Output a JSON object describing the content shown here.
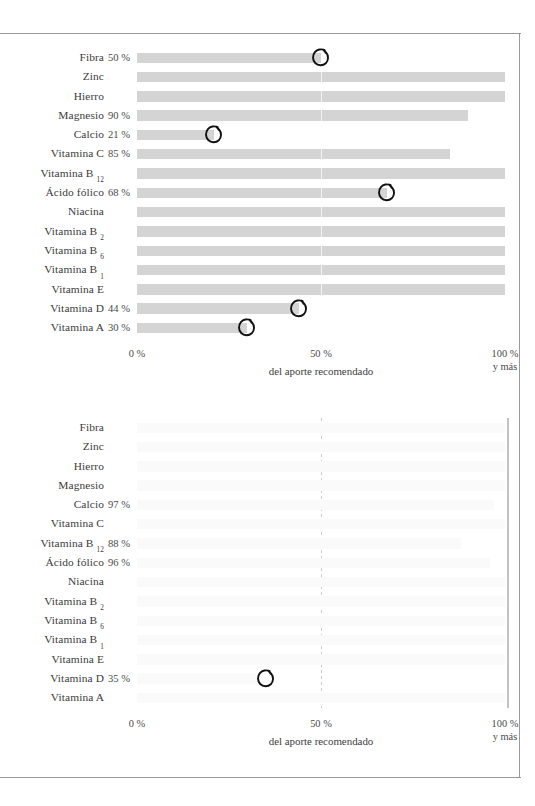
{
  "page": {
    "frame_color": "#9a9a9a",
    "background": "#ffffff"
  },
  "axis": {
    "tick_0": "0 %",
    "tick_50": "50 %",
    "tick_100": "100 %",
    "tick_100_sub": "y más",
    "caption": "del aporte recomendado"
  },
  "chart_data": [
    {
      "type": "bar",
      "id": "chart-top",
      "title": "",
      "xlabel": "del aporte recomendado",
      "ylabel": "",
      "xlim": [
        0,
        100
      ],
      "xticks": [
        0,
        50,
        100
      ],
      "xticklabels": [
        "0 %",
        "50 %",
        "100 %"
      ],
      "grid": false,
      "orientation": "horizontal",
      "bar_color": "#d4d4d4",
      "marker_note": "hand-drawn pen circle annotation",
      "categories": [
        "Fibra",
        "Zinc",
        "Hierro",
        "Magnesio",
        "Calcio",
        "Vitamina C",
        "Vitamina B12",
        "Ácido fólico",
        "Niacina",
        "Vitamina B2",
        "Vitamina B6",
        "Vitamina B1",
        "Vitamina E",
        "Vitamina D",
        "Vitamina A"
      ],
      "rows": [
        {
          "label": "Fibra",
          "sub": "",
          "value": 50,
          "value_label": "50 %",
          "marked": true
        },
        {
          "label": "Zinc",
          "sub": "",
          "value": 100,
          "value_label": "",
          "marked": false
        },
        {
          "label": "Hierro",
          "sub": "",
          "value": 100,
          "value_label": "",
          "marked": false
        },
        {
          "label": "Magnesio",
          "sub": "",
          "value": 90,
          "value_label": "90 %",
          "marked": false
        },
        {
          "label": "Calcio",
          "sub": "",
          "value": 21,
          "value_label": "21 %",
          "marked": true
        },
        {
          "label": "Vitamina C",
          "sub": "",
          "value": 85,
          "value_label": "85 %",
          "marked": false
        },
        {
          "label": "Vitamina B",
          "sub": "12",
          "value": 100,
          "value_label": "",
          "marked": false
        },
        {
          "label": "Ácido fólico",
          "sub": "",
          "value": 68,
          "value_label": "68 %",
          "marked": true
        },
        {
          "label": "Niacina",
          "sub": "",
          "value": 100,
          "value_label": "",
          "marked": false
        },
        {
          "label": "Vitamina B",
          "sub": "2",
          "value": 100,
          "value_label": "",
          "marked": false
        },
        {
          "label": "Vitamina B",
          "sub": "6",
          "value": 100,
          "value_label": "",
          "marked": false
        },
        {
          "label": "Vitamina B",
          "sub": "1",
          "value": 100,
          "value_label": "",
          "marked": false
        },
        {
          "label": "Vitamina E",
          "sub": "",
          "value": 100,
          "value_label": "",
          "marked": false
        },
        {
          "label": "Vitamina D",
          "sub": "",
          "value": 44,
          "value_label": "44 %",
          "marked": true
        },
        {
          "label": "Vitamina A",
          "sub": "",
          "value": 30,
          "value_label": "30 %",
          "marked": true
        }
      ]
    },
    {
      "type": "bar",
      "id": "chart-bottom",
      "title": "",
      "xlabel": "del aporte recomendado",
      "ylabel": "",
      "xlim": [
        0,
        100
      ],
      "xticks": [
        0,
        50,
        100
      ],
      "xticklabels": [
        "0 %",
        "50 %",
        "100 %"
      ],
      "grid": false,
      "orientation": "horizontal",
      "bar_color": "#fafafa",
      "reference_line_at": 50,
      "marker_note": "hand-drawn pen circle annotation",
      "categories": [
        "Fibra",
        "Zinc",
        "Hierro",
        "Magnesio",
        "Calcio",
        "Vitamina C",
        "Vitamina B12",
        "Ácido fólico",
        "Niacina",
        "Vitamina B2",
        "Vitamina B6",
        "Vitamina B1",
        "Vitamina E",
        "Vitamina D",
        "Vitamina A"
      ],
      "rows": [
        {
          "label": "Fibra",
          "sub": "",
          "value": 100,
          "value_label": "",
          "marked": false
        },
        {
          "label": "Zinc",
          "sub": "",
          "value": 100,
          "value_label": "",
          "marked": false
        },
        {
          "label": "Hierro",
          "sub": "",
          "value": 100,
          "value_label": "",
          "marked": false
        },
        {
          "label": "Magnesio",
          "sub": "",
          "value": 100,
          "value_label": "",
          "marked": false
        },
        {
          "label": "Calcio",
          "sub": "",
          "value": 97,
          "value_label": "97 %",
          "marked": false
        },
        {
          "label": "Vitamina C",
          "sub": "",
          "value": 100,
          "value_label": "",
          "marked": false
        },
        {
          "label": "Vitamina B",
          "sub": "12",
          "value": 88,
          "value_label": "88 %",
          "marked": false
        },
        {
          "label": "Ácido fólico",
          "sub": "",
          "value": 96,
          "value_label": "96 %",
          "marked": false
        },
        {
          "label": "Niacina",
          "sub": "",
          "value": 100,
          "value_label": "",
          "marked": false
        },
        {
          "label": "Vitamina B",
          "sub": "2",
          "value": 100,
          "value_label": "",
          "marked": false
        },
        {
          "label": "Vitamina B",
          "sub": "6",
          "value": 100,
          "value_label": "",
          "marked": false
        },
        {
          "label": "Vitamina B",
          "sub": "1",
          "value": 100,
          "value_label": "",
          "marked": false
        },
        {
          "label": "Vitamina E",
          "sub": "",
          "value": 100,
          "value_label": "",
          "marked": false
        },
        {
          "label": "Vitamina D",
          "sub": "",
          "value": 35,
          "value_label": "35 %",
          "marked": true
        },
        {
          "label": "Vitamina A",
          "sub": "",
          "value": 100,
          "value_label": "",
          "marked": false
        }
      ]
    }
  ]
}
